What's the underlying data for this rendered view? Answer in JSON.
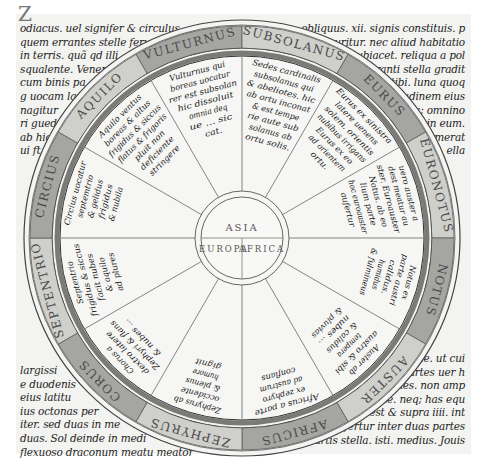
{
  "document": {
    "type": "medieval manuscript page",
    "subject": "wind diagram (rota ventorum) with T-O map at centre"
  },
  "margin_text": {
    "top_left": [
      "odiacus. uel signifer & circulus",
      "quem errantes stelle feru",
      "in terris. quã qd illi",
      "squalente. Veneris",
      "cum binis pa",
      "g uocam lam",
      "nagitur",
      "ri guede",
      "ab hic",
      "ui ft"
    ],
    "top_right": [
      "obliquus. xii. signis constituis. p",
      "curitur. nec aliud habitatio",
      "subiacet. reliqua a pol",
      "ranti stella gradit",
      "tibi. luna quoq",
      "tudinem eius",
      "s; omnino",
      "in eum.",
      "merat",
      "ella"
    ],
    "bottom_left": [
      "largissi",
      "e duodenis",
      "eius latitu",
      "ius octonas per",
      "iter. sed duas in me",
      "duas. Sol deinde in medi",
      "flexuoso draconum meatu meator"
    ],
    "bottom_right": [
      "me. ut cui",
      "partes uer h",
      "dines. non amp",
      "rete. neq; has equ",
      "dio est & supra iiii. int",
      "o fertur inter duas partes",
      "tis. Martis stella. isti. medius. Jouis"
    ]
  },
  "rota": {
    "ring_labels": [
      "VULTURNUS",
      "SUBSOLANUS",
      "EURUS",
      "EURONOTUS",
      "NOTUS",
      "AUSTER",
      "AFRICUS",
      "ZEPHYRUS",
      "CORUS",
      "SEPTENTRIO",
      "CIRCIUS",
      "AQUILO"
    ],
    "sector_texts": [
      [
        "Vulturnus qui",
        "boreas uocatur",
        "rer est subsolan",
        "hic dissoluit",
        "omnia deq",
        "ue ... sic",
        "cat."
      ],
      [
        "Sedes cardinalis",
        "subsolanus qui",
        "& abeliotes. hic",
        "ab ortu inconat",
        "& est tempe",
        "rie aute sub",
        "solanus ab",
        "ortu solis."
      ],
      [
        "Eurus ex sinistra",
        "latere uenens",
        "solem. orientis",
        "nubibus irrigans",
        "Eurus ex eo",
        "ad orientem",
        "ortu."
      ],
      [
        "uero auster a",
        "dest meatur au",
        "ster. Euroauster",
        "Notus. ab eo",
        "lium parte",
        "hoc euroauster",
        "aufertur"
      ],
      [
        "Notus ex",
        "parte austri",
        "calidus.",
        "humidus",
        "& fulmineus"
      ],
      [
        "Auster ab",
        "austro & sibi",
        "tempera",
        "& calidus",
        "nubes ...",
        "& pluvias"
      ],
      [
        "Africus a parte",
        "ex zephyro",
        "ad austrum",
        "conflans"
      ],
      [
        "Zephyrus ab",
        "occidente",
        "& plenus",
        "humore",
        "gignit"
      ],
      [
        "Chorus a",
        "dextro latere",
        "Zephyri & flans",
        "& nubes ..."
      ],
      [
        "Septentrio",
        "frigidus & siccus",
        "facit nubes",
        "& aquilo",
        "ad plures"
      ],
      [
        "Circius uocatur",
        "septemtrio",
        "& gelidus",
        "frigidus",
        "& nubila"
      ],
      [
        "Aquilo ventus",
        "boreas & altus",
        "frigidus & siccus",
        "flatus & frigoris",
        "pluit non",
        "deficiente",
        "stringere"
      ]
    ],
    "center_map": {
      "top": "ASIA",
      "bottom_left": "EUROPA",
      "bottom_right": "AFRICA"
    },
    "colors": {
      "ring_band": "#8f8f8c",
      "ring_band_light": "#c9c9c6",
      "ink": "#1a1a1a",
      "parchment": "#f3f3f1",
      "rule": "#555555"
    }
  }
}
